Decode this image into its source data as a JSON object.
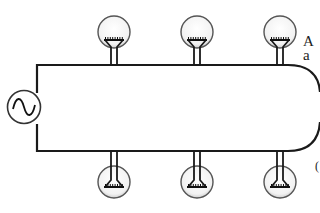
{
  "diagram": {
    "source": {
      "type": "ac-source",
      "symbol": "sine-wave-icon"
    },
    "bulbs_top": [
      {
        "id": "bulb-top-1"
      },
      {
        "id": "bulb-top-2"
      },
      {
        "id": "bulb-top-3"
      }
    ],
    "bulbs_bottom": [
      {
        "id": "bulb-bottom-1"
      },
      {
        "id": "bulb-bottom-2"
      },
      {
        "id": "bulb-bottom-3"
      }
    ],
    "colors": {
      "wire": "#1a1a1a",
      "bulb_fill": "#f4f4f4",
      "bulb_outline": "#555555"
    }
  },
  "side_text": {
    "line1": "A",
    "line2": "a",
    "line3": "("
  }
}
